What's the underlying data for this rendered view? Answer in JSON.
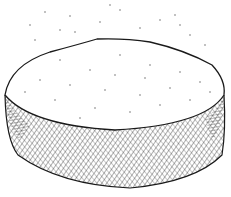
{
  "illustration": {
    "subject": "round cake or cheese wheel, pen-and-ink drawing",
    "style": "black ink crosshatching on white",
    "colors": {
      "ink": "#1a1a1a",
      "background": "#ffffff"
    }
  }
}
